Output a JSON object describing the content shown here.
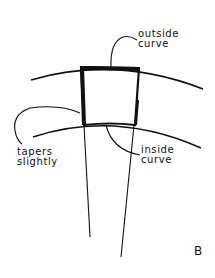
{
  "diagram": {
    "type": "hand-drawn sketch",
    "colors": {
      "ink": "#111111",
      "background": "#ffffff"
    },
    "labels": {
      "outside_curve": "outside\ncurve",
      "inside_curve": "inside\ncurve",
      "tapers_slightly": "tapers\nslightly",
      "figure_letter": "B"
    },
    "elements": [
      {
        "id": "outer-arc",
        "description": "upper arc (outside curve)"
      },
      {
        "id": "inner-arc",
        "description": "lower arc (inside curve)"
      },
      {
        "id": "wedge-block",
        "description": "bold-outlined quadrilateral between arcs, slightly tapering"
      },
      {
        "id": "radial-lines",
        "description": "two converging lines extending below the block"
      },
      {
        "id": "leader-lines",
        "description": "curved pointer lines from labels to block edges"
      }
    ]
  }
}
